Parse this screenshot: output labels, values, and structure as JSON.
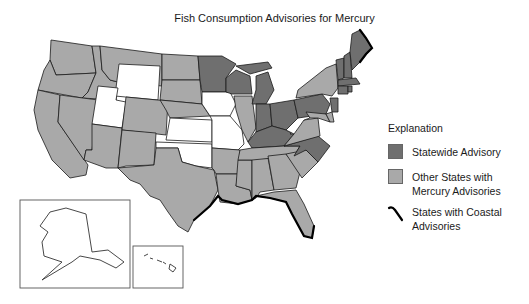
{
  "title": "Fish Consumption Advisories for Mercury",
  "colors": {
    "statewide": "#6f6f6f",
    "other": "#a9a9a9",
    "none": "#ffffff",
    "border": "#1a1a1a",
    "coastal": "#000000"
  },
  "legend": {
    "heading": "Explanation",
    "items": [
      {
        "key": "statewide",
        "label": "Statewide Advisory",
        "symbol": "dark-gray-swatch"
      },
      {
        "key": "other",
        "label": "Other States with Mercury Advisories",
        "symbol": "light-gray-swatch"
      },
      {
        "key": "coastal",
        "label": "States with Coastal Advisories",
        "symbol": "black-wavy-line"
      }
    ]
  },
  "insets": [
    "Alaska",
    "Hawaii"
  ],
  "states": {
    "statewide": [
      "MN",
      "WI",
      "MI",
      "IN",
      "OH",
      "KY",
      "PA",
      "NJ",
      "NC",
      "ME",
      "NH",
      "VT",
      "MA",
      "CT",
      "RI",
      "MO?"
    ],
    "none": [
      "WY",
      "UT",
      "IA",
      "KS",
      "OK",
      "WV",
      "NE-east"
    ],
    "other": [
      "WA",
      "OR",
      "CA",
      "ID",
      "NV",
      "MT",
      "AZ",
      "CO",
      "NM",
      "ND",
      "SD",
      "NE",
      "TX",
      "LA",
      "AR",
      "MS",
      "AL",
      "GA",
      "FL",
      "SC",
      "TN",
      "VA",
      "NY",
      "IL",
      "MD",
      "DE"
    ]
  },
  "coastal_advisories": [
    "TX",
    "LA",
    "MS",
    "AL",
    "FL",
    "ME"
  ]
}
